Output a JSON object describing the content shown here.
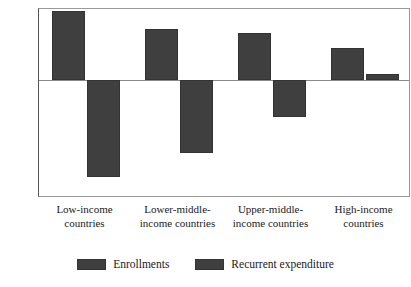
{
  "chart_data": {
    "type": "bar",
    "title": "",
    "subtitle": "",
    "xlabel": "",
    "ylabel": "",
    "ylim": [
      -15,
      9
    ],
    "yticks": [
      9,
      6,
      3,
      0,
      -3,
      -6,
      -9,
      -12,
      -15
    ],
    "ytick_labels": [
      "9",
      "6",
      "3",
      "0",
      "−3",
      "−6",
      "−9",
      "−12",
      "−15"
    ],
    "grid": false,
    "legend_position": "bottom",
    "categories": [
      "Low-income countries",
      "Lower-middle-income countries",
      "Upper-middle-income countries",
      "High-income countries"
    ],
    "category_label_lines": [
      [
        "Low-income",
        "countries"
      ],
      [
        "Lower-middle-",
        "income countries"
      ],
      [
        "Upper-middle-",
        "income countries"
      ],
      [
        "High-income",
        "countries"
      ]
    ],
    "series": [
      {
        "name": "Enrollments",
        "color": "#3f3f3f",
        "values": [
          8.7,
          6.5,
          6.0,
          4.1
        ]
      },
      {
        "name": "Recurrent expenditure",
        "color": "#3f3f3f",
        "values": [
          -12.3,
          -9.3,
          -4.7,
          0.8
        ]
      }
    ]
  },
  "legend": {
    "entries": [
      {
        "label": "Enrollments",
        "color": "#3f3f3f"
      },
      {
        "label": "Recurrent expenditure",
        "color": "#3f3f3f"
      }
    ]
  },
  "colors": {
    "bar_fill": "#3f3f3f",
    "bar_edge": "#333333",
    "axis": "#555555",
    "frame": "#9a9a9a",
    "zero_line": "#8a8a8a",
    "background": "#ffffff",
    "text": "#1a1a1a"
  }
}
